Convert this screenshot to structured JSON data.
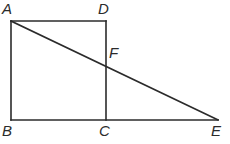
{
  "figure": {
    "canvas": {
      "width": 230,
      "height": 144,
      "background": "#ffffff"
    },
    "stroke": {
      "color": "#2b2b2b",
      "width": 1.6
    },
    "points": {
      "A": {
        "x": 11,
        "y": 21
      },
      "B": {
        "x": 11,
        "y": 120
      },
      "C": {
        "x": 106,
        "y": 120
      },
      "D": {
        "x": 106,
        "y": 21
      },
      "E": {
        "x": 218,
        "y": 120
      },
      "F": {
        "x": 106,
        "y": 62
      }
    },
    "segments": [
      {
        "name": "segment-AD",
        "from": "A",
        "to": "D"
      },
      {
        "name": "segment-AB",
        "from": "A",
        "to": "B"
      },
      {
        "name": "segment-DC",
        "from": "D",
        "to": "C"
      },
      {
        "name": "segment-BE",
        "from": "B",
        "to": "E"
      },
      {
        "name": "segment-AE",
        "from": "A",
        "to": "E"
      }
    ],
    "labels": {
      "A": {
        "text": "A",
        "x": 2,
        "y": 1
      },
      "B": {
        "text": "B",
        "x": 2,
        "y": 123
      },
      "C": {
        "text": "C",
        "x": 99,
        "y": 123
      },
      "D": {
        "text": "D",
        "x": 98,
        "y": 1
      },
      "E": {
        "text": "E",
        "x": 211,
        "y": 123
      },
      "F": {
        "text": "F",
        "x": 109,
        "y": 45
      }
    }
  }
}
